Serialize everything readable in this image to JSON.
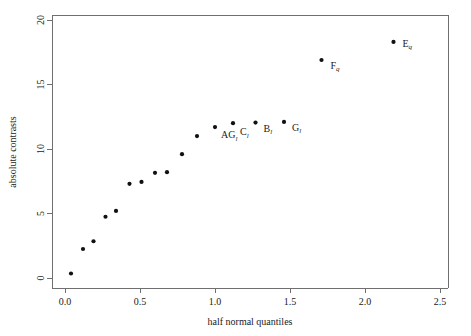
{
  "chart_data": {
    "type": "scatter",
    "title": "",
    "xlabel": "half normal quantiles",
    "ylabel": "absolute contrasts",
    "xlim": [
      -0.07,
      2.58
    ],
    "ylim": [
      -0.6,
      20.9
    ],
    "xticks": [
      "0.0",
      "0.5",
      "1.0",
      "1.5",
      "2.0",
      "2.5"
    ],
    "xtick_values": [
      0.0,
      0.5,
      1.0,
      1.5,
      2.0,
      2.5
    ],
    "yticks": [
      "0",
      "5",
      "10",
      "15",
      "20"
    ],
    "ytick_values": [
      0,
      5,
      10,
      15,
      20
    ],
    "grid": false,
    "legend": "none",
    "x": [
      0.04,
      0.12,
      0.19,
      0.27,
      0.34,
      0.43,
      0.51,
      0.6,
      0.68,
      0.78,
      0.88,
      1.0,
      1.12,
      1.27,
      1.46,
      1.71,
      2.19
    ],
    "y": [
      0.35,
      2.25,
      2.85,
      4.75,
      5.2,
      7.3,
      7.45,
      8.15,
      8.2,
      9.6,
      11.0,
      11.7,
      12.0,
      12.05,
      12.1,
      16.9,
      18.3
    ],
    "point_labels": [
      {
        "base": "AG",
        "sub": "l",
        "x": 1.0,
        "y": 11.7,
        "dx": 6,
        "dy": 11
      },
      {
        "base": "C",
        "sub": "l",
        "x": 1.12,
        "y": 12.0,
        "dx": 7,
        "dy": 12
      },
      {
        "base": "B",
        "sub": "l",
        "x": 1.27,
        "y": 12.05,
        "dx": 8,
        "dy": 9
      },
      {
        "base": "G",
        "sub": "l",
        "x": 1.46,
        "y": 12.1,
        "dx": 8,
        "dy": 9
      },
      {
        "base": "F",
        "sub": "q",
        "x": 1.71,
        "y": 16.9,
        "dx": 9,
        "dy": 9
      },
      {
        "base": "E",
        "sub": "q",
        "x": 2.19,
        "y": 18.3,
        "dx": 9,
        "dy": 5
      }
    ],
    "colors": {
      "point": "#111111",
      "axis": "#6f6f6f",
      "text": "#1a1a1a",
      "background": "#ffffff"
    }
  },
  "plot_geometry": {
    "frame_left": 52,
    "frame_top": 15,
    "frame_right": 448,
    "frame_bottom": 288,
    "x0_px": 65,
    "x_unit_px": 150,
    "y0_px": 278,
    "y_unit_px": 12.9
  }
}
